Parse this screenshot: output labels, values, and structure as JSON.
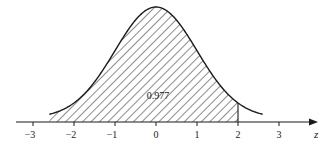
{
  "chart_data": {
    "type": "area",
    "title": "",
    "subtitle": "",
    "xlabel": "z",
    "ylabel": "",
    "distribution": "standard normal density",
    "x_ticks": [
      -3,
      -2,
      -1,
      0,
      1,
      2,
      3
    ],
    "x_tick_labels": [
      "−3",
      "−2",
      "−1",
      "0",
      "1",
      "2",
      "3"
    ],
    "xlim": [
      -3.4,
      3.9
    ],
    "curve_range": [
      -2.6,
      2.6
    ],
    "shaded_region": {
      "from": -2.6,
      "to": 2,
      "pattern": "diagonal hatch"
    },
    "annotations": [
      {
        "text": "0.977",
        "x": 0.0,
        "meaning": "area to the left of z = 2"
      }
    ],
    "grid": false,
    "legend": null
  },
  "colors": {
    "ink": "#1a1a1a",
    "hatch": "#2b2b2b",
    "background": "#ffffff"
  }
}
